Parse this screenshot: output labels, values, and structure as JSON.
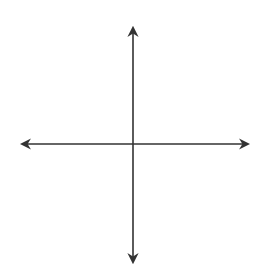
{
  "diagram": {
    "type": "coordinate-plane",
    "x_axis_label": "x",
    "y_axis_label": "y",
    "x_range": [
      -5,
      5
    ],
    "y_range": [
      -5,
      5
    ],
    "grid_color": "#d9d9d9",
    "axis_color": "#333333",
    "x_ticks": [
      {
        "value": -4,
        "label": "⁻4"
      },
      {
        "value": -3,
        "label": "⁻3"
      },
      {
        "value": -2,
        "label": "⁻2"
      },
      {
        "value": -1,
        "label": "⁻1"
      },
      {
        "value": 1,
        "label": "1"
      },
      {
        "value": 2,
        "label": "2"
      },
      {
        "value": 3,
        "label": "3"
      },
      {
        "value": 4,
        "label": "4"
      }
    ],
    "y_ticks": [
      {
        "value": 4,
        "label": "4"
      },
      {
        "value": 3,
        "label": "3"
      },
      {
        "value": 2,
        "label": "2"
      },
      {
        "value": 1,
        "label": "1"
      },
      {
        "value": -1,
        "label": "⁻1"
      },
      {
        "value": -2,
        "label": "⁻2"
      },
      {
        "value": -3,
        "label": "⁻3"
      },
      {
        "value": -4,
        "label": "⁻4"
      }
    ]
  }
}
